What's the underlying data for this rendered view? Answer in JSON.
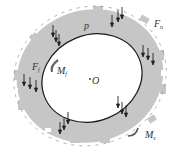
{
  "diagram": {
    "type": "annular ring with distributed forces and moments",
    "labels": {
      "pressure": "p",
      "normal_force": {
        "main": "F",
        "sub": "n"
      },
      "friction_force": {
        "main": "F",
        "sub": "f"
      },
      "friction_moment": {
        "main": "M",
        "sub": "f"
      },
      "center": "O",
      "outer_moment": {
        "main": "M",
        "sub": "s"
      }
    },
    "colors": {
      "ring_fill": "#c6c6c6",
      "inner_edge": "#1a1a1a",
      "arrows": "#222222",
      "background": "#ffffff"
    }
  }
}
